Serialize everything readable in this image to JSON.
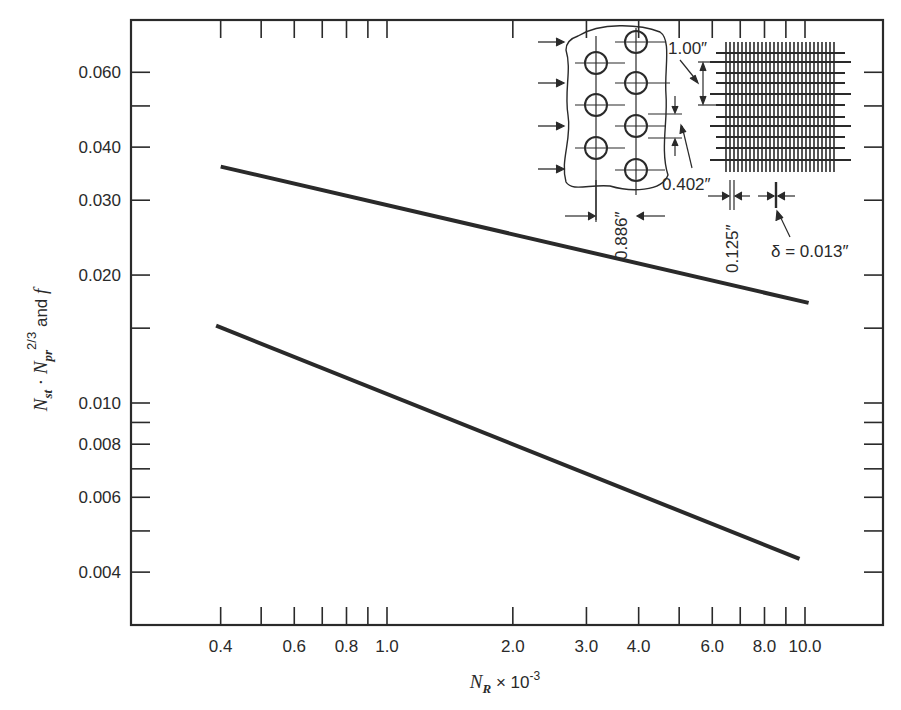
{
  "chart_data": {
    "type": "line",
    "title": "",
    "xscale": "log",
    "yscale": "log",
    "xlabel": "N_R × 10^-3",
    "xlabel_parts": {
      "main": "N",
      "sub": "R",
      "rest": " × 10",
      "sup": "-3"
    },
    "ylabel": "N_st · N_pr^(2/3) and f",
    "ylabel_parts": {
      "n1": "N",
      "sub1": "st",
      "dot": " · ",
      "n2": "N",
      "sub2": "pr",
      "sup2": "2/3",
      "rest": " and ",
      "f": "f"
    },
    "xlim": [
      0.3,
      14
    ],
    "ylim": [
      0.0028,
      0.08
    ],
    "x_tick_labels": [
      "0.4",
      "0.6",
      "0.8",
      "1.0",
      "2.0",
      "3.0",
      "4.0",
      "6.0",
      "8.0",
      "10.0"
    ],
    "x_tick_values": [
      0.4,
      0.5,
      0.6,
      0.7,
      0.8,
      0.9,
      1.0,
      2.0,
      3.0,
      4.0,
      5.0,
      6.0,
      7.0,
      8.0,
      9.0,
      10.0
    ],
    "y_tick_labels": [
      "0.060",
      "0.040",
      "0.030",
      "0.020",
      "0.010",
      "0.008",
      "0.006",
      "0.004"
    ],
    "y_tick_values": [
      0.06,
      0.05,
      0.04,
      0.03,
      0.02,
      0.015,
      0.01,
      0.009,
      0.008,
      0.007,
      0.006,
      0.005,
      0.004
    ],
    "grid": false,
    "legend": null,
    "series": [
      {
        "name": "f (friction factor)",
        "x": [
          0.4,
          10.2
        ],
        "y": [
          0.036,
          0.0172
        ]
      },
      {
        "name": "N_st · N_pr^(2/3)",
        "x": [
          0.39,
          9.7
        ],
        "y": [
          0.0152,
          0.0043
        ]
      }
    ],
    "annotations": {
      "inset_title": "Screen-mesh / staggered-tube matrix geometry",
      "dim_pitch_transverse": "1.00″",
      "dim_tube_spacing": "0.402″",
      "dim_row_spacing": "0.886″",
      "dim_mesh_pitch": "0.125″",
      "dim_wire_diameter": "δ = 0.013″"
    }
  }
}
